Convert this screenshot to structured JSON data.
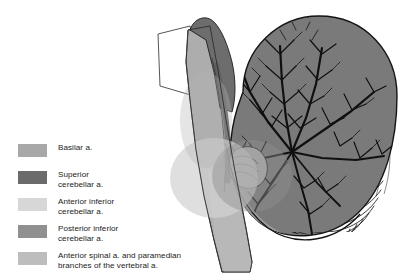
{
  "figure": {
    "background_color": "#ffffff",
    "outline_color": "#111111",
    "structures": [
      {
        "name": "midbrain-cap",
        "label": "Midbrain",
        "fill": "#6e6e6e"
      },
      {
        "name": "pons-brainstem",
        "label": "Pons and medulla (basilar territory)",
        "fill": "#a9a9a9"
      },
      {
        "name": "cut-surface-wedge",
        "label": "Cut surface",
        "fill": "#ffffff"
      },
      {
        "name": "cerebellar-hemisphere-superior",
        "label": "Superior cerebellar artery territory",
        "fill": "#787878"
      },
      {
        "name": "cerebellar-folia-inferior",
        "label": "Inferior cerebellar folia",
        "fill": "#9a9a9a"
      },
      {
        "name": "aica-territory-overlay",
        "label": "Anterior inferior cerebellar artery territory",
        "fill": "#c9c9c9"
      },
      {
        "name": "pica-territory-overlay",
        "label": "Posterior inferior cerebellar artery territory",
        "fill": "#8f8f8f"
      },
      {
        "name": "anterior-spinal-territory",
        "label": "Anterior spinal artery territory",
        "fill": "#b6b6b6"
      }
    ]
  },
  "legend": {
    "items": [
      {
        "swatch_color": "#a8a8a8",
        "label": "Basilar a.",
        "name": "basilar-artery"
      },
      {
        "swatch_color": "#6b6b6b",
        "label": "Superior\ncerebellar a.",
        "name": "superior-cerebellar-artery"
      },
      {
        "swatch_color": "#d7d7d7",
        "label": "Anterior inferior\ncerebellar a.",
        "name": "anterior-inferior-cerebellar-artery"
      },
      {
        "swatch_color": "#909090",
        "label": "Posterior inferior\ncerebellar a.",
        "name": "posterior-inferior-cerebellar-artery"
      },
      {
        "swatch_color": "#bdbdbd",
        "label": "Anterior spinal a. and paramedian\nbranches of the vertebral a.",
        "name": "anterior-spinal-artery"
      }
    ]
  }
}
